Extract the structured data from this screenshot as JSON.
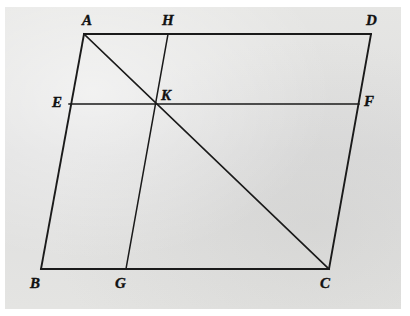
{
  "figure": {
    "background_color": "#ffffff",
    "paper_color": "#e3e3e1",
    "ink_color": "#1a1a1a",
    "line_width": 1.6,
    "points": [
      {
        "id": "A",
        "label": "A",
        "x": 84,
        "y": 34,
        "label_x": 82,
        "label_y": 13,
        "vertex": true
      },
      {
        "id": "H",
        "label": "H",
        "x": 168,
        "y": 34,
        "label_x": 162,
        "label_y": 13,
        "vertex": false
      },
      {
        "id": "D",
        "label": "D",
        "x": 371,
        "y": 34,
        "label_x": 366,
        "label_y": 13,
        "vertex": true
      },
      {
        "id": "E",
        "label": "E",
        "x": 69,
        "y": 104,
        "label_x": 52,
        "label_y": 95,
        "vertex": false
      },
      {
        "id": "K",
        "label": "K",
        "x": 159,
        "y": 106,
        "label_x": 161,
        "label_y": 88,
        "vertex": false
      },
      {
        "id": "F",
        "label": "F",
        "x": 359,
        "y": 104,
        "label_x": 364,
        "label_y": 94,
        "vertex": false
      },
      {
        "id": "B",
        "label": "B",
        "x": 41,
        "y": 269,
        "label_x": 30,
        "label_y": 276,
        "vertex": true
      },
      {
        "id": "G",
        "label": "G",
        "x": 126,
        "y": 269,
        "label_x": 115,
        "label_y": 276,
        "vertex": false
      },
      {
        "id": "C",
        "label": "C",
        "x": 329,
        "y": 269,
        "label_x": 320,
        "label_y": 276,
        "vertex": true
      }
    ],
    "segments": [
      {
        "id": "AD",
        "name": "top-side-AD",
        "from": "A",
        "to": "D",
        "width": 1.9
      },
      {
        "id": "AB",
        "name": "left-side-AB",
        "from": "A",
        "to": "B",
        "width": 1.9
      },
      {
        "id": "BC",
        "name": "bottom-side-BC",
        "from": "B",
        "to": "C",
        "width": 1.9
      },
      {
        "id": "DC",
        "name": "right-side-DC",
        "from": "D",
        "to": "C",
        "width": 1.9
      },
      {
        "id": "EF",
        "name": "midline-EF",
        "from": "E",
        "to": "F",
        "width": 1.5
      },
      {
        "id": "HG",
        "name": "midline-HG",
        "from": "H",
        "to": "G",
        "width": 1.5
      },
      {
        "id": "AC",
        "name": "diagonal-AC",
        "from": "A",
        "to": "C",
        "width": 1.7
      }
    ],
    "labels_note": "Vertex letters are bold italic serif capitals."
  }
}
